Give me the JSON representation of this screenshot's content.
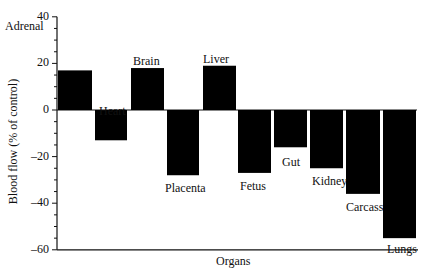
{
  "chart_data": {
    "type": "bar",
    "title": "",
    "xlabel": "Organs",
    "ylabel": "Blood flow (% of control)",
    "ylim": [
      -60,
      40
    ],
    "yticks": [
      40,
      20,
      0,
      -20,
      -40,
      -60
    ],
    "grid": false,
    "legend": null,
    "categories": [
      "Adrenal",
      "Heart",
      "Brain",
      "Placenta",
      "Liver",
      "Fetus",
      "Gut",
      "Kidney",
      "Carcass",
      "Lungs"
    ],
    "values": [
      17,
      -13,
      18,
      -28,
      19,
      -27,
      -16,
      -25,
      -36,
      -55
    ]
  }
}
